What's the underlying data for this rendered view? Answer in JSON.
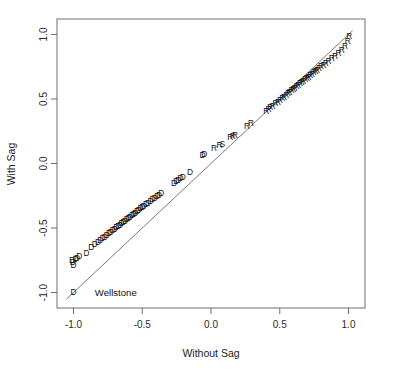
{
  "chart_data": {
    "type": "scatter",
    "title": "",
    "xlabel": "Without Sag",
    "ylabel": "With Sag",
    "xlim": [
      -1.12,
      1.12
    ],
    "ylim": [
      -1.12,
      1.12
    ],
    "grid": false,
    "legend": "none",
    "xticks": [
      -1.0,
      -0.5,
      0.0,
      0.5,
      1.0
    ],
    "xtick_labels": [
      "-1.0",
      "-0.5",
      "0.0",
      "0.5",
      "1.0"
    ],
    "yticks": [
      -1.0,
      -0.5,
      0.0,
      0.5,
      1.0
    ],
    "ytick_labels": [
      "-1.0",
      "-0.5",
      "0.0",
      "0.5",
      "1.0"
    ],
    "reference_line": {
      "type": "identity",
      "label": "y = x",
      "x0": -1.05,
      "y0": -1.05,
      "x1": 1.03,
      "y1": 1.03
    },
    "annotations": [
      {
        "text": "Wellstone",
        "x": -0.845,
        "y": -1.005
      }
    ],
    "point_label_field": "party",
    "points": [
      {
        "x": -1.0,
        "y": -1.0,
        "party": "D"
      },
      {
        "x": -1.01,
        "y": -0.755,
        "party": "D"
      },
      {
        "x": -1.005,
        "y": -0.772,
        "party": "D"
      },
      {
        "x": -1.0,
        "y": -0.79,
        "party": "D"
      },
      {
        "x": -0.985,
        "y": -0.745,
        "party": "D"
      },
      {
        "x": -0.975,
        "y": -0.735,
        "party": "D"
      },
      {
        "x": -0.958,
        "y": -0.722,
        "party": "D"
      },
      {
        "x": -0.905,
        "y": -0.7,
        "party": "D"
      },
      {
        "x": -0.87,
        "y": -0.65,
        "party": "D"
      },
      {
        "x": -0.845,
        "y": -0.632,
        "party": "D"
      },
      {
        "x": -0.822,
        "y": -0.615,
        "party": "D"
      },
      {
        "x": -0.805,
        "y": -0.6,
        "party": "D"
      },
      {
        "x": -0.788,
        "y": -0.586,
        "party": "D"
      },
      {
        "x": -0.772,
        "y": -0.572,
        "party": "D"
      },
      {
        "x": -0.758,
        "y": -0.56,
        "party": "D"
      },
      {
        "x": -0.742,
        "y": -0.548,
        "party": "D"
      },
      {
        "x": -0.728,
        "y": -0.536,
        "party": "D"
      },
      {
        "x": -0.715,
        "y": -0.525,
        "party": "D"
      },
      {
        "x": -0.7,
        "y": -0.512,
        "party": "D"
      },
      {
        "x": -0.688,
        "y": -0.502,
        "party": "D"
      },
      {
        "x": -0.675,
        "y": -0.492,
        "party": "D"
      },
      {
        "x": -0.662,
        "y": -0.48,
        "party": "D"
      },
      {
        "x": -0.65,
        "y": -0.47,
        "party": "D"
      },
      {
        "x": -0.638,
        "y": -0.46,
        "party": "D"
      },
      {
        "x": -0.625,
        "y": -0.448,
        "party": "D"
      },
      {
        "x": -0.612,
        "y": -0.438,
        "party": "D"
      },
      {
        "x": -0.6,
        "y": -0.428,
        "party": "D"
      },
      {
        "x": -0.588,
        "y": -0.418,
        "party": "D"
      },
      {
        "x": -0.575,
        "y": -0.406,
        "party": "D"
      },
      {
        "x": -0.562,
        "y": -0.396,
        "party": "D"
      },
      {
        "x": -0.55,
        "y": -0.386,
        "party": "D"
      },
      {
        "x": -0.538,
        "y": -0.376,
        "party": "D"
      },
      {
        "x": -0.525,
        "y": -0.364,
        "party": "D"
      },
      {
        "x": -0.512,
        "y": -0.354,
        "party": "D"
      },
      {
        "x": -0.5,
        "y": -0.344,
        "party": "D"
      },
      {
        "x": -0.488,
        "y": -0.334,
        "party": "D"
      },
      {
        "x": -0.472,
        "y": -0.322,
        "party": "D"
      },
      {
        "x": -0.458,
        "y": -0.31,
        "party": "D"
      },
      {
        "x": -0.44,
        "y": -0.296,
        "party": "D"
      },
      {
        "x": -0.425,
        "y": -0.284,
        "party": "D"
      },
      {
        "x": -0.408,
        "y": -0.272,
        "party": "D"
      },
      {
        "x": -0.392,
        "y": -0.258,
        "party": "D"
      },
      {
        "x": -0.378,
        "y": -0.247,
        "party": "D"
      },
      {
        "x": -0.362,
        "y": -0.236,
        "party": "D"
      },
      {
        "x": -0.268,
        "y": -0.155,
        "party": "D"
      },
      {
        "x": -0.252,
        "y": -0.142,
        "party": "D"
      },
      {
        "x": -0.238,
        "y": -0.132,
        "party": "D"
      },
      {
        "x": -0.222,
        "y": -0.12,
        "party": "D"
      },
      {
        "x": -0.205,
        "y": -0.108,
        "party": "D"
      },
      {
        "x": -0.152,
        "y": -0.072,
        "party": "D"
      },
      {
        "x": -0.062,
        "y": 0.058,
        "party": "D"
      },
      {
        "x": -0.048,
        "y": 0.07,
        "party": "D"
      },
      {
        "x": 0.022,
        "y": 0.112,
        "party": "R"
      },
      {
        "x": 0.062,
        "y": 0.138,
        "party": "R"
      },
      {
        "x": 0.082,
        "y": 0.146,
        "party": "S"
      },
      {
        "x": 0.14,
        "y": 0.196,
        "party": "R"
      },
      {
        "x": 0.158,
        "y": 0.206,
        "party": "R"
      },
      {
        "x": 0.175,
        "y": 0.218,
        "party": "R"
      },
      {
        "x": 0.262,
        "y": 0.286,
        "party": "R"
      },
      {
        "x": 0.292,
        "y": 0.306,
        "party": "R"
      },
      {
        "x": 0.402,
        "y": 0.402,
        "party": "R"
      },
      {
        "x": 0.418,
        "y": 0.416,
        "party": "R"
      },
      {
        "x": 0.432,
        "y": 0.428,
        "party": "R"
      },
      {
        "x": 0.448,
        "y": 0.44,
        "party": "R"
      },
      {
        "x": 0.47,
        "y": 0.46,
        "party": "R"
      },
      {
        "x": 0.488,
        "y": 0.474,
        "party": "R"
      },
      {
        "x": 0.502,
        "y": 0.486,
        "party": "R"
      },
      {
        "x": 0.518,
        "y": 0.5,
        "party": "R"
      },
      {
        "x": 0.532,
        "y": 0.512,
        "party": "R"
      },
      {
        "x": 0.548,
        "y": 0.526,
        "party": "R"
      },
      {
        "x": 0.56,
        "y": 0.538,
        "party": "R"
      },
      {
        "x": 0.572,
        "y": 0.548,
        "party": "R"
      },
      {
        "x": 0.585,
        "y": 0.56,
        "party": "R"
      },
      {
        "x": 0.598,
        "y": 0.572,
        "party": "R"
      },
      {
        "x": 0.61,
        "y": 0.582,
        "party": "R"
      },
      {
        "x": 0.622,
        "y": 0.592,
        "party": "R"
      },
      {
        "x": 0.635,
        "y": 0.604,
        "party": "R"
      },
      {
        "x": 0.648,
        "y": 0.616,
        "party": "R"
      },
      {
        "x": 0.66,
        "y": 0.626,
        "party": "R"
      },
      {
        "x": 0.672,
        "y": 0.636,
        "party": "R"
      },
      {
        "x": 0.685,
        "y": 0.648,
        "party": "R"
      },
      {
        "x": 0.698,
        "y": 0.658,
        "party": "R"
      },
      {
        "x": 0.71,
        "y": 0.668,
        "party": "R"
      },
      {
        "x": 0.722,
        "y": 0.678,
        "party": "R"
      },
      {
        "x": 0.735,
        "y": 0.69,
        "party": "R"
      },
      {
        "x": 0.748,
        "y": 0.7,
        "party": "R"
      },
      {
        "x": 0.76,
        "y": 0.712,
        "party": "R"
      },
      {
        "x": 0.772,
        "y": 0.722,
        "party": "R"
      },
      {
        "x": 0.785,
        "y": 0.732,
        "party": "R"
      },
      {
        "x": 0.8,
        "y": 0.746,
        "party": "R"
      },
      {
        "x": 0.818,
        "y": 0.76,
        "party": "R"
      },
      {
        "x": 0.835,
        "y": 0.772,
        "party": "R"
      },
      {
        "x": 0.855,
        "y": 0.79,
        "party": "R"
      },
      {
        "x": 0.878,
        "y": 0.808,
        "party": "R"
      },
      {
        "x": 0.902,
        "y": 0.828,
        "party": "R"
      },
      {
        "x": 0.928,
        "y": 0.852,
        "party": "R"
      },
      {
        "x": 0.952,
        "y": 0.876,
        "party": "R"
      },
      {
        "x": 0.975,
        "y": 0.902,
        "party": "R"
      },
      {
        "x": 0.995,
        "y": 0.945,
        "party": "R"
      },
      {
        "x": 1.005,
        "y": 0.985,
        "party": "R"
      }
    ]
  }
}
